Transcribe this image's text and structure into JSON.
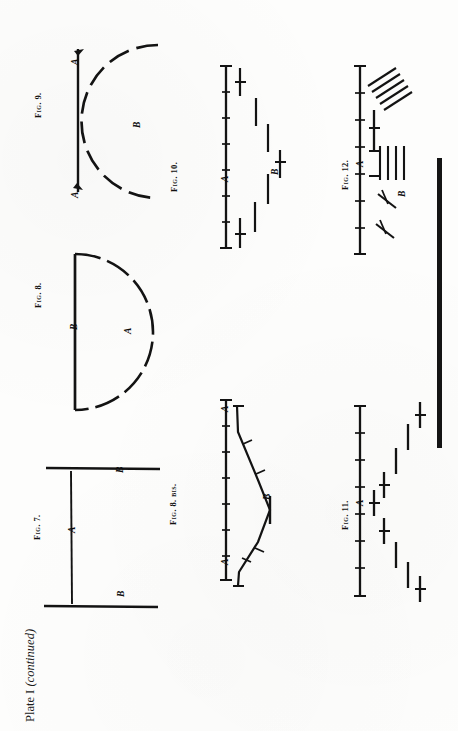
{
  "plate": {
    "title_main": "Plate I",
    "title_note": "(continued)",
    "orientation": "rotated-90-ccw",
    "ink_color": "#131313",
    "paper_color": "#fdfdfc"
  },
  "figures": [
    {
      "id": "fig-7",
      "caption": "Fig. 7.",
      "type": "two-parallel-rules-with-normal",
      "labels": [
        {
          "text": "A",
          "role": "center-line"
        },
        {
          "text": "B",
          "role": "upper-rule"
        },
        {
          "text": "B",
          "role": "lower-rule"
        }
      ]
    },
    {
      "id": "fig-8",
      "caption": "Fig. 8.",
      "type": "straight-chord-with-dashed-arc",
      "labels": [
        {
          "text": "B",
          "role": "straight-chord"
        },
        {
          "text": "A",
          "role": "dashed-semicircular-arc"
        }
      ]
    },
    {
      "id": "fig-8-bis",
      "caption": "Fig. 8. bis.",
      "type": "straight-scale-with-chevron-trace",
      "labels": [
        {
          "text": "A",
          "role": "scale-line-top"
        },
        {
          "text": "A",
          "role": "scale-line-bottom"
        },
        {
          "text": "B",
          "role": "chevron-trace"
        }
      ],
      "tick_count": 8
    },
    {
      "id": "fig-9",
      "caption": "Fig. 9.",
      "type": "straight-rule-with-dashed-bulging-arc",
      "labels": [
        {
          "text": "A",
          "role": "straight-rule-top"
        },
        {
          "text": "A",
          "role": "straight-rule-bottom"
        },
        {
          "text": "B",
          "role": "dashed-arc"
        }
      ]
    },
    {
      "id": "fig-10",
      "caption": "Fig. 10.",
      "type": "ticked-scale-with-broken-dash-trace",
      "labels": [
        {
          "text": "A",
          "role": "scale-line"
        },
        {
          "text": "B",
          "role": "dash-trace"
        }
      ],
      "tick_count": 8,
      "dash_count": 6
    },
    {
      "id": "fig-11",
      "caption": "Fig. 11.",
      "type": "ticked-scale-with-diagonal-dash-trace",
      "labels": [
        {
          "text": "A",
          "role": "scale-line"
        }
      ],
      "tick_count": 8,
      "dash_count": 8
    },
    {
      "id": "fig-12",
      "caption": "Fig. 12.",
      "type": "ticked-scale-with-hatched-groups",
      "labels": [
        {
          "text": "A",
          "role": "scale-line"
        },
        {
          "text": "B",
          "role": "hatched-trace"
        }
      ],
      "tick_count": 8,
      "hatch_groups": 2
    }
  ]
}
